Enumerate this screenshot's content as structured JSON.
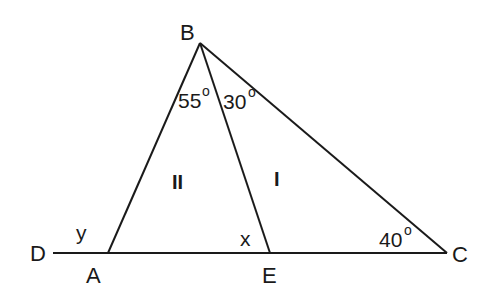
{
  "diagram": {
    "type": "triangle-geometry",
    "points": {
      "B": {
        "label": "B",
        "x": 200,
        "y": 43
      },
      "A": {
        "label": "A",
        "x": 108,
        "y": 253
      },
      "E": {
        "label": "E",
        "x": 270,
        "y": 253
      },
      "C": {
        "label": "C",
        "x": 447,
        "y": 253
      },
      "D": {
        "label": "D",
        "x": 53,
        "y": 253
      }
    },
    "segments": [
      {
        "from": "D",
        "to": "C",
        "name": "baseline-DC"
      },
      {
        "from": "A",
        "to": "B",
        "name": "side-AB"
      },
      {
        "from": "B",
        "to": "C",
        "name": "side-BC"
      },
      {
        "from": "B",
        "to": "E",
        "name": "segment-BE"
      }
    ],
    "angles": {
      "angle_ABE": {
        "value": "55",
        "unit": "o"
      },
      "angle_EBC": {
        "value": "30",
        "unit": "o"
      },
      "angle_BCE": {
        "value": "40",
        "unit": "o"
      },
      "angle_BAD": {
        "label": "y"
      },
      "angle_BEA": {
        "label": "x"
      }
    },
    "regions": {
      "left_triangle": {
        "label": "II"
      },
      "right_triangle": {
        "label": "I"
      }
    },
    "colors": {
      "stroke": "#1a1a1a",
      "background": "#ffffff"
    }
  }
}
